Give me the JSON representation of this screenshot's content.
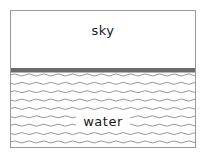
{
  "diagram": {
    "frame": {
      "border_color": "#9a9a9a",
      "background": "#ffffff"
    },
    "regions": [
      {
        "id": "sky",
        "label": "sky",
        "fill": "#ffffff",
        "text_color": "#1a1a1a"
      },
      {
        "id": "water",
        "label": "water",
        "fill": "#ffffff",
        "wave_color": "#8a8a8a",
        "text_color": "#1a1a1a"
      }
    ],
    "horizon": {
      "name": "horizon-line",
      "color": "#6a6a6a",
      "under_color": "#b4b4b4"
    },
    "waves": {
      "rows": 10,
      "row_spacing": 8.6,
      "wavelength": 14.5,
      "amplitude": 2.1,
      "stroke_color": "#8a8a8a",
      "stroke_width": 0.9
    }
  }
}
